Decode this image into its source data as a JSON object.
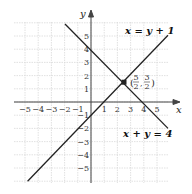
{
  "figure": {
    "axes": {
      "x_label": "x",
      "y_label": "y",
      "x_range": [
        -5,
        5
      ],
      "y_range": [
        -5,
        5
      ]
    },
    "x_ticks": [
      "−5",
      "−4",
      "−3",
      "−2",
      "−1",
      "1",
      "2",
      "3",
      "4",
      "5"
    ],
    "y_ticks": [
      "5",
      "4",
      "3",
      "2",
      "1",
      "−1",
      "−2",
      "−3",
      "−4",
      "−5"
    ],
    "lines": [
      {
        "label": "x = y + 1",
        "equation": "x = y + 1"
      },
      {
        "label": "x + y = 4",
        "equation": "x + y = 4"
      }
    ],
    "intersection": {
      "x_num": "5",
      "x_den": "2",
      "y_num": "3",
      "y_den": "2"
    }
  }
}
